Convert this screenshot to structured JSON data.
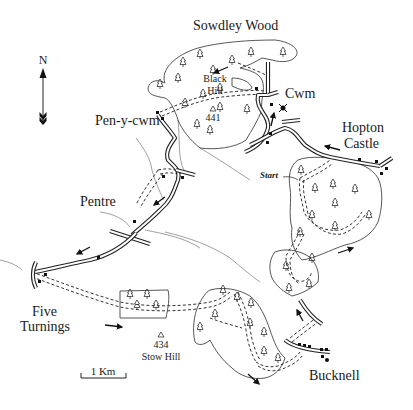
{
  "map": {
    "north_label": "N",
    "scale_label": "1 Km",
    "places": {
      "sowdley_wood": "Sowdley Wood",
      "cwm": "Cwm",
      "pen_y_cwm": "Pen-y-cwm",
      "hopton": "Hopton",
      "castle": "Castle",
      "pentre": "Pentre",
      "five": "Five",
      "turnings": "Turnings",
      "bucknell": "Bucknell",
      "start": "Start"
    },
    "hills": [
      {
        "name_line1": "Black",
        "name_line2": "Hill",
        "height": "441"
      },
      {
        "name": "Stow Hill",
        "height": "434"
      }
    ],
    "colors": {
      "ink": "#1a1a1a",
      "background": "#ffffff",
      "stream": "#777777"
    }
  }
}
